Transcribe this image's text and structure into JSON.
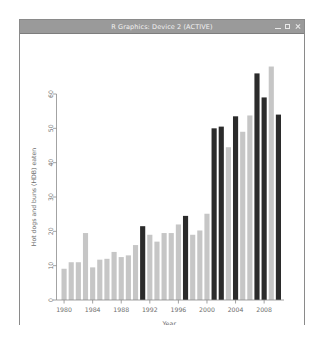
{
  "window": {
    "title": "R Graphics: Device 2 (ACTIVE)",
    "controls": [
      {
        "name": "minimize",
        "glyph": "minimize-icon"
      },
      {
        "name": "maximize",
        "glyph": "maximize-icon"
      },
      {
        "name": "close",
        "glyph": "close-icon"
      }
    ]
  },
  "colors": {
    "bar_light": "#c6c6c6",
    "bar_dark": "#2b2b2b",
    "axis": "#8c8c8c",
    "text": "#6e6e6e",
    "canvas_bg": "#ffffff",
    "titlebar_bg": "#9a9a9a",
    "window_border": "#8a8a8a"
  },
  "chart_data": {
    "type": "bar",
    "title": "",
    "xlabel": "Year",
    "ylabel": "Hot dogs and buns (HDB) eaten",
    "ylim": [
      0,
      70
    ],
    "yticks": [
      0,
      10,
      20,
      30,
      40,
      50,
      60
    ],
    "xticks": [
      1980,
      1984,
      1988,
      1992,
      1996,
      2000,
      2004,
      2008
    ],
    "grid": false,
    "legend": null,
    "categories": [
      1980,
      1981,
      1982,
      1983,
      1984,
      1985,
      1986,
      1987,
      1988,
      1989,
      1990,
      1991,
      1992,
      1993,
      1994,
      1995,
      1996,
      1997,
      1998,
      1999,
      2000,
      2001,
      2002,
      2003,
      2004,
      2005,
      2006,
      2007,
      2008,
      2009,
      2010
    ],
    "values": [
      9.1,
      11.0,
      11.0,
      19.5,
      9.5,
      11.75,
      12.0,
      14.0,
      12.5,
      13.0,
      16.0,
      21.5,
      19.0,
      17.0,
      19.5,
      19.5,
      22.0,
      24.5,
      19.0,
      20.25,
      25.125,
      50.0,
      50.5,
      44.5,
      53.5,
      49.0,
      53.75,
      66.0,
      59.0,
      68.0,
      54.0
    ],
    "highlight": [
      false,
      false,
      false,
      false,
      false,
      false,
      false,
      false,
      false,
      false,
      false,
      true,
      false,
      false,
      false,
      false,
      false,
      true,
      false,
      false,
      false,
      true,
      true,
      false,
      true,
      false,
      false,
      true,
      true,
      false,
      true
    ],
    "series": [
      {
        "name": "Hot dogs eaten",
        "values": [
          9.1,
          11.0,
          11.0,
          19.5,
          9.5,
          11.75,
          12.0,
          14.0,
          12.5,
          13.0,
          16.0,
          21.5,
          19.0,
          17.0,
          19.5,
          19.5,
          22.0,
          24.5,
          19.0,
          20.25,
          25.125,
          50.0,
          50.5,
          44.5,
          53.5,
          49.0,
          53.75,
          66.0,
          59.0,
          68.0,
          54.0
        ]
      }
    ]
  }
}
